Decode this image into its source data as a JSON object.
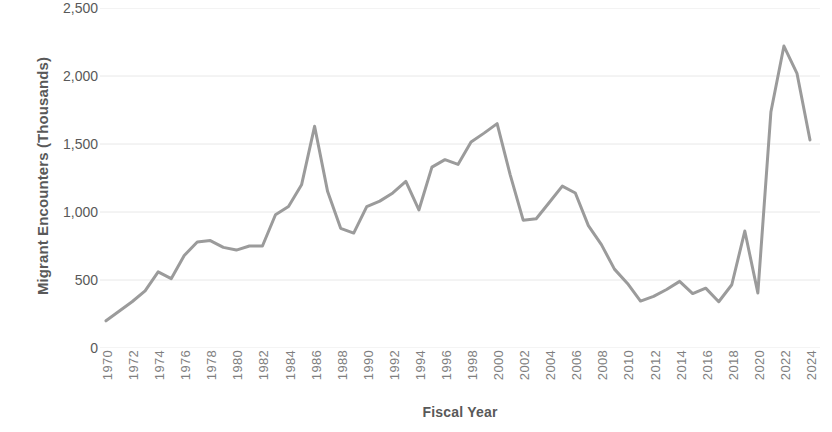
{
  "chart_data": {
    "type": "line",
    "title": "",
    "xlabel": "Fiscal Year",
    "ylabel": "Migrant Encounters (Thousands)",
    "xlim": [
      1970,
      2024
    ],
    "ylim": [
      0,
      2500
    ],
    "y_ticks": [
      0,
      500,
      1000,
      1500,
      2000,
      2500
    ],
    "y_tick_labels": [
      "0",
      "500",
      "1,000",
      "1,500",
      "2,000",
      "2,500"
    ],
    "x_tick_labels": [
      "1970",
      "1972",
      "1974",
      "1976",
      "1978",
      "1980",
      "1982",
      "1984",
      "1986",
      "1988",
      "1990",
      "1992",
      "1994",
      "1996",
      "1998",
      "2000",
      "2002",
      "2004",
      "2006",
      "2008",
      "2010",
      "2012",
      "2014",
      "2016",
      "2018",
      "2020",
      "2022",
      "2024"
    ],
    "x_tick_step": 2,
    "grid": "horizontal",
    "legend": "none",
    "line_color": "#9b9b9b",
    "line_width": 3,
    "axis_text_color": "#595959",
    "tick_text_color": "#7f7f7f",
    "gridline_color": "#e8e8e8",
    "series": [
      {
        "name": "Migrant Encounters",
        "x": [
          1970,
          1971,
          1972,
          1973,
          1974,
          1975,
          1976,
          1977,
          1978,
          1979,
          1980,
          1981,
          1982,
          1983,
          1984,
          1985,
          1986,
          1987,
          1988,
          1989,
          1990,
          1991,
          1992,
          1993,
          1994,
          1995,
          1996,
          1997,
          1998,
          1999,
          2000,
          2001,
          2002,
          2003,
          2004,
          2005,
          2006,
          2007,
          2008,
          2009,
          2010,
          2011,
          2012,
          2013,
          2014,
          2015,
          2016,
          2017,
          2018,
          2019,
          2020,
          2021,
          2022,
          2023,
          2024
        ],
        "values": [
          200,
          270,
          340,
          420,
          560,
          510,
          680,
          780,
          790,
          740,
          720,
          750,
          750,
          980,
          1040,
          1200,
          1630,
          1150,
          880,
          845,
          1040,
          1080,
          1140,
          1225,
          1015,
          1330,
          1385,
          1350,
          1515,
          1580,
          1650,
          1275,
          940,
          950,
          1070,
          1190,
          1140,
          900,
          760,
          580,
          475,
          345,
          380,
          430,
          490,
          400,
          440,
          340,
          465,
          860,
          405,
          1735,
          2220,
          2020,
          1530
        ]
      }
    ]
  }
}
